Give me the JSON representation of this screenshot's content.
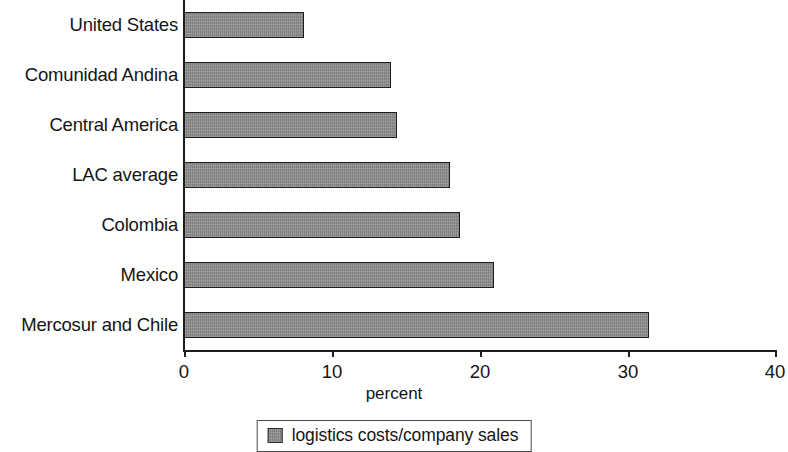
{
  "chart_data": {
    "type": "bar",
    "orientation": "horizontal",
    "title": "",
    "subtitle": "",
    "xlabel": "percent",
    "ylabel": "",
    "categories": [
      "United States",
      "Comunidad Andina",
      "Central America",
      "LAC average",
      "Colombia",
      "Mexico",
      "Mercosur and Chile"
    ],
    "values": [
      8.1,
      14.0,
      14.4,
      18.0,
      18.7,
      21.0,
      31.5
    ],
    "series": [
      {
        "name": "logistics costs/company sales",
        "values": [
          8.1,
          14.0,
          14.4,
          18.0,
          18.7,
          21.0,
          31.5
        ]
      }
    ],
    "xlim": [
      0,
      40
    ],
    "xticks": [
      0,
      10,
      20,
      30,
      40
    ],
    "xtick_labels": [
      "0",
      "10",
      "20",
      "30",
      "40"
    ],
    "grid": false,
    "legend": {
      "position": "bottom-center",
      "entries": [
        {
          "label": "logistics costs/company sales",
          "color": "#8d8d8d"
        }
      ]
    },
    "colors": {
      "bar_fill": "#8d8d8d",
      "bar_edge": "#1d1d1d",
      "axis": "#1d1d1d",
      "text": "#151515",
      "background": "#ffffff"
    }
  }
}
